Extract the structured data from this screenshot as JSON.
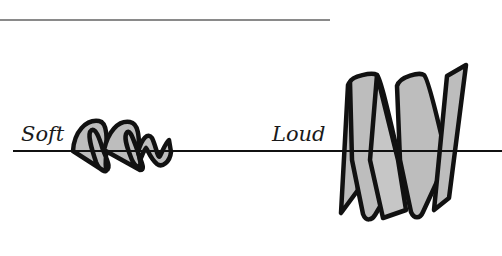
{
  "diagram": {
    "top_rule": {
      "x1": 0,
      "x2": 330,
      "y": 20,
      "color": "#8a8a8a"
    },
    "baseline": {
      "x1": 13,
      "x2": 502,
      "y": 151,
      "color": "#111111"
    },
    "labels": {
      "soft": "Soft",
      "loud": "Loud"
    },
    "waves": [
      {
        "name": "soft-wave",
        "description": "Low-amplitude twisted ribbon wave",
        "fill": "#bdbdbd"
      },
      {
        "name": "loud-wave",
        "description": "High-amplitude twisted ribbon wave",
        "fill": "#bdbdbd"
      }
    ]
  }
}
